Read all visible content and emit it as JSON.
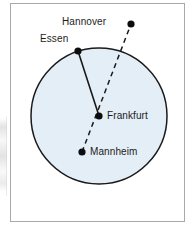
{
  "figure": {
    "background_color": "#ffffff",
    "frame_color": "#a9a9a9"
  },
  "circle": {
    "name": "circle-shape",
    "center_label": "Frankfurt",
    "fill_color": "#e4eef6",
    "stroke_color": "#1a1a1a",
    "center_x": 99,
    "center_y": 116,
    "radius": 68
  },
  "points": [
    {
      "id": "hannover",
      "label": "Hannover",
      "x": 131,
      "y": 24,
      "position": "outside-circle",
      "label_side": "left"
    },
    {
      "id": "essen",
      "label": "Essen",
      "x": 78,
      "y": 51,
      "position": "on-circle",
      "label_side": "left"
    },
    {
      "id": "frankfurt",
      "label": "Frankfurt",
      "x": 99,
      "y": 116,
      "position": "center",
      "label_side": "right"
    },
    {
      "id": "mannheim",
      "label": "Mannheim",
      "x": 82,
      "y": 152,
      "position": "inside-circle",
      "label_side": "right"
    }
  ],
  "lines": [
    {
      "id": "essen-frankfurt",
      "style": "solid",
      "from": "essen",
      "to": "frankfurt",
      "color": "#1a1a1a"
    },
    {
      "id": "mannheim-hannover",
      "style": "dashed",
      "from": "mannheim",
      "through": "frankfurt",
      "to": "hannover",
      "color": "#1a1a1a"
    }
  ],
  "dot": {
    "color": "#0d0d0d",
    "radius": 3.6
  }
}
